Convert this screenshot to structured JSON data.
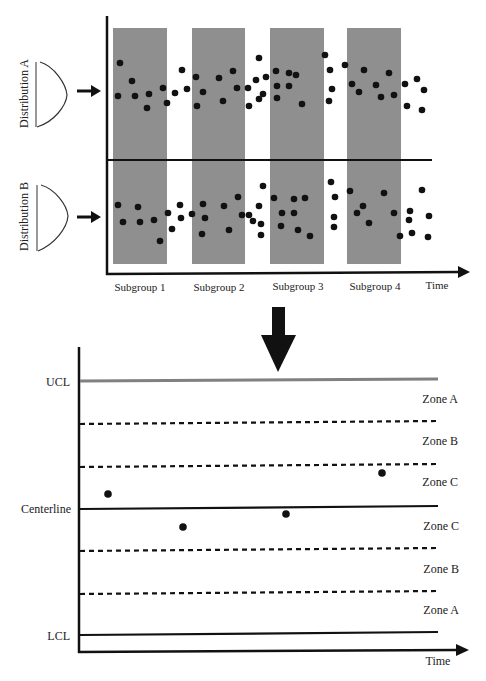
{
  "top_diagram": {
    "distribution_a_label": "Distribution A",
    "distribution_b_label": "Distribution B",
    "x_axis_label": "Time",
    "subgroups": [
      {
        "label": "Subgroup 1",
        "x0": 113,
        "x1": 167
      },
      {
        "label": "Subgroup 2",
        "x0": 192,
        "x1": 245
      },
      {
        "label": "Subgroup 3",
        "x0": 270,
        "x1": 324
      },
      {
        "label": "Subgroup 4",
        "x0": 347,
        "x1": 401
      }
    ],
    "band_color": "#8f8f8f",
    "dots_a": [
      [
        120,
        63
      ],
      [
        118,
        96
      ],
      [
        132,
        81
      ],
      [
        135,
        96
      ],
      [
        147,
        108
      ],
      [
        149,
        94
      ],
      [
        163,
        88
      ],
      [
        167,
        103
      ],
      [
        175,
        93
      ],
      [
        182,
        70
      ],
      [
        187,
        89
      ],
      [
        196,
        77
      ],
      [
        197,
        106
      ],
      [
        203,
        92
      ],
      [
        219,
        78
      ],
      [
        223,
        101
      ],
      [
        233,
        71
      ],
      [
        237,
        88
      ],
      [
        248,
        88
      ],
      [
        249,
        106
      ],
      [
        256,
        80
      ],
      [
        259,
        58
      ],
      [
        263,
        94
      ],
      [
        259,
        99
      ],
      [
        266,
        77
      ],
      [
        276,
        71
      ],
      [
        277,
        86
      ],
      [
        277,
        98
      ],
      [
        289,
        73
      ],
      [
        289,
        86
      ],
      [
        296,
        75
      ],
      [
        302,
        104
      ],
      [
        325,
        55
      ],
      [
        330,
        70
      ],
      [
        332,
        89
      ],
      [
        329,
        101
      ],
      [
        345,
        65
      ],
      [
        352,
        84
      ],
      [
        359,
        92
      ],
      [
        364,
        70
      ],
      [
        376,
        85
      ],
      [
        381,
        97
      ],
      [
        389,
        73
      ],
      [
        394,
        95
      ],
      [
        405,
        84
      ],
      [
        417,
        79
      ],
      [
        424,
        90
      ],
      [
        407,
        106
      ],
      [
        422,
        110
      ]
    ],
    "dots_b": [
      [
        118,
        205
      ],
      [
        123,
        222
      ],
      [
        138,
        207
      ],
      [
        140,
        222
      ],
      [
        154,
        220
      ],
      [
        160,
        241
      ],
      [
        168,
        213
      ],
      [
        172,
        229
      ],
      [
        180,
        205
      ],
      [
        181,
        218
      ],
      [
        192,
        214
      ],
      [
        203,
        204
      ],
      [
        205,
        218
      ],
      [
        202,
        234
      ],
      [
        224,
        206
      ],
      [
        229,
        230
      ],
      [
        238,
        197
      ],
      [
        242,
        215
      ],
      [
        249,
        215
      ],
      [
        253,
        221
      ],
      [
        259,
        206
      ],
      [
        263,
        186
      ],
      [
        261,
        224
      ],
      [
        261,
        235
      ],
      [
        274,
        198
      ],
      [
        282,
        213
      ],
      [
        281,
        226
      ],
      [
        294,
        199
      ],
      [
        294,
        213
      ],
      [
        298,
        230
      ],
      [
        305,
        198
      ],
      [
        310,
        236
      ],
      [
        331,
        182
      ],
      [
        335,
        197
      ],
      [
        334,
        217
      ],
      [
        334,
        227
      ],
      [
        350,
        191
      ],
      [
        357,
        213
      ],
      [
        363,
        206
      ],
      [
        369,
        223
      ],
      [
        384,
        193
      ],
      [
        394,
        213
      ],
      [
        400,
        236
      ],
      [
        409,
        220
      ],
      [
        410,
        211
      ],
      [
        422,
        190
      ],
      [
        429,
        216
      ],
      [
        412,
        233
      ],
      [
        428,
        237
      ]
    ]
  },
  "bottom_chart": {
    "y_labels": {
      "ucl": "UCL",
      "centerline": "Centerline",
      "lcl": "LCL"
    },
    "x_axis_label": "Time",
    "zones_upper": [
      "Zone A",
      "Zone B",
      "Zone C"
    ],
    "zones_lower": [
      "Zone C",
      "Zone B",
      "Zone A"
    ],
    "ucl_color": "#808080",
    "points": [
      [
        108,
        494
      ],
      [
        183,
        527
      ],
      [
        286,
        514
      ],
      [
        382,
        473
      ]
    ]
  },
  "chart_data": {
    "type": "scatter",
    "xlabel": "Time",
    "ylabel": "",
    "grid": false,
    "legend": "none",
    "categories": [
      "Subgroup 1",
      "Subgroup 2",
      "Subgroup 3",
      "Subgroup 4"
    ],
    "limit_lines": [
      "UCL",
      "Centerline",
      "LCL"
    ],
    "zones": {
      "above_centerline": [
        "Zone C",
        "Zone B",
        "Zone A"
      ],
      "below_centerline": [
        "Zone C",
        "Zone B",
        "Zone A"
      ]
    },
    "series": [
      {
        "name": "Subgroup means (relative to centerline, sigma units)",
        "values": [
          0.45,
          -0.55,
          -0.2,
          1.0
        ]
      }
    ],
    "source_distributions": [
      "Distribution A",
      "Distribution B"
    ]
  }
}
